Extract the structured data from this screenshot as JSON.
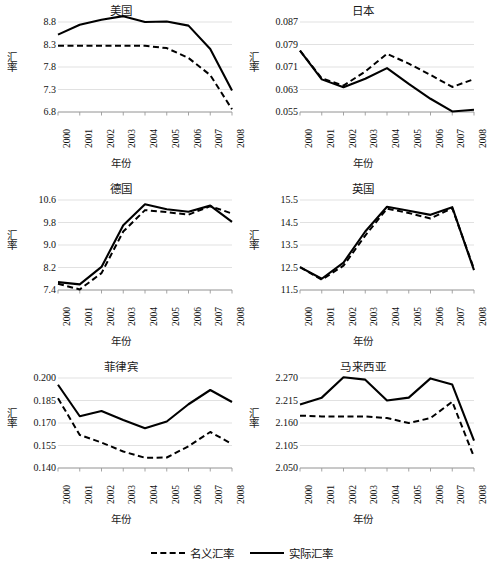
{
  "figure": {
    "legend": [
      {
        "label": "名义汇率",
        "style": "dashed",
        "color": "#000000"
      },
      {
        "label": "实际汇率",
        "style": "solid",
        "color": "#000000"
      }
    ]
  },
  "chart_data": [
    {
      "type": "line",
      "title": "美国",
      "xlabel": "年份",
      "ylabel": "汇率",
      "x": [
        "2000",
        "2001",
        "2002",
        "2003",
        "2004",
        "2005",
        "2006",
        "2007",
        "2008"
      ],
      "yticks": [
        "6.8",
        "7.3",
        "7.8",
        "8.3",
        "8.8"
      ],
      "ylim": [
        6.8,
        8.8
      ],
      "grid": true,
      "legend_position": "figure-bottom",
      "series": [
        {
          "name": "实际汇率",
          "style": "solid",
          "values": [
            8.52,
            8.74,
            8.85,
            8.93,
            8.8,
            8.81,
            8.72,
            8.2,
            7.28
          ]
        },
        {
          "name": "名义汇率",
          "style": "dashed",
          "values": [
            8.27,
            8.27,
            8.27,
            8.27,
            8.27,
            8.22,
            8.0,
            7.62,
            6.86
          ]
        }
      ]
    },
    {
      "type": "line",
      "title": "日本",
      "xlabel": "年份",
      "ylabel": "汇率",
      "x": [
        "2000",
        "2001",
        "2002",
        "2003",
        "2004",
        "2005",
        "2006",
        "2007",
        "2008"
      ],
      "yticks": [
        "0.055",
        "0.063",
        "0.071",
        "0.079",
        "0.087"
      ],
      "ylim": [
        0.055,
        0.087
      ],
      "grid": true,
      "legend_position": "figure-bottom",
      "series": [
        {
          "name": "实际汇率",
          "style": "solid",
          "values": [
            0.0768,
            0.0666,
            0.0638,
            0.0668,
            0.0706,
            0.065,
            0.0597,
            0.0552,
            0.0558
          ]
        },
        {
          "name": "名义汇率",
          "style": "dashed",
          "values": [
            0.0768,
            0.067,
            0.0644,
            0.0694,
            0.0757,
            0.0722,
            0.0682,
            0.0639,
            0.0667
          ]
        }
      ]
    },
    {
      "type": "line",
      "title": "德国",
      "xlabel": "年份",
      "ylabel": "汇率",
      "x": [
        "2000",
        "2001",
        "2002",
        "2003",
        "2004",
        "2005",
        "2006",
        "2007",
        "2008"
      ],
      "yticks": [
        "7.4",
        "8.2",
        "9.0",
        "9.8",
        "10.6"
      ],
      "ylim": [
        7.4,
        10.6
      ],
      "grid": true,
      "legend_position": "figure-bottom",
      "series": [
        {
          "name": "实际汇率",
          "style": "solid",
          "values": [
            7.68,
            7.6,
            8.22,
            9.7,
            10.45,
            10.27,
            10.18,
            10.4,
            9.82
          ]
        },
        {
          "name": "名义汇率",
          "style": "dashed",
          "values": [
            7.62,
            7.42,
            8.0,
            9.48,
            10.24,
            10.17,
            10.08,
            10.38,
            10.12
          ]
        }
      ]
    },
    {
      "type": "line",
      "title": "英国",
      "xlabel": "年份",
      "ylabel": "汇率",
      "x": [
        "2000",
        "2001",
        "2002",
        "2003",
        "2004",
        "2005",
        "2006",
        "2007",
        "2008"
      ],
      "yticks": [
        "11.5",
        "12.5",
        "13.5",
        "14.5",
        "15.5"
      ],
      "ylim": [
        11.5,
        15.5
      ],
      "grid": true,
      "legend_position": "figure-bottom",
      "series": [
        {
          "name": "实际汇率",
          "style": "solid",
          "values": [
            12.52,
            12.0,
            12.72,
            14.1,
            15.2,
            15.02,
            14.84,
            15.18,
            12.38
          ]
        },
        {
          "name": "名义汇率",
          "style": "dashed",
          "values": [
            12.52,
            11.96,
            12.58,
            13.92,
            15.12,
            14.92,
            14.68,
            15.14,
            12.44
          ]
        }
      ]
    },
    {
      "type": "line",
      "title": "菲律宾",
      "xlabel": "年份",
      "ylabel": "汇率",
      "x": [
        "2000",
        "2001",
        "2002",
        "2003",
        "2004",
        "2005",
        "2006",
        "2007",
        "2008"
      ],
      "yticks": [
        "0.140",
        "0.155",
        "0.170",
        "0.185",
        "0.200"
      ],
      "ylim": [
        0.14,
        0.2
      ],
      "grid": true,
      "legend_position": "figure-bottom",
      "series": [
        {
          "name": "实际汇率",
          "style": "solid",
          "values": [
            0.1955,
            0.1745,
            0.178,
            0.172,
            0.1665,
            0.171,
            0.1825,
            0.192,
            0.184
          ]
        },
        {
          "name": "名义汇率",
          "style": "dashed",
          "values": [
            0.1865,
            0.162,
            0.157,
            0.151,
            0.1468,
            0.147,
            0.1545,
            0.164,
            0.156
          ]
        }
      ]
    },
    {
      "type": "line",
      "title": "马来西亚",
      "xlabel": "年份",
      "ylabel": "汇率",
      "x": [
        "2000",
        "2001",
        "2002",
        "2003",
        "2004",
        "2005",
        "2006",
        "2007",
        "2008"
      ],
      "yticks": [
        "2.050",
        "2.105",
        "2.160",
        "2.215",
        "2.270"
      ],
      "ylim": [
        2.05,
        2.27
      ],
      "grid": true,
      "legend_position": "figure-bottom",
      "series": [
        {
          "name": "实际汇率",
          "style": "solid",
          "values": [
            2.205,
            2.222,
            2.272,
            2.266,
            2.215,
            2.222,
            2.269,
            2.254,
            2.117
          ]
        },
        {
          "name": "名义汇率",
          "style": "dashed",
          "values": [
            2.178,
            2.176,
            2.176,
            2.176,
            2.172,
            2.16,
            2.172,
            2.212,
            2.077
          ]
        }
      ]
    }
  ]
}
